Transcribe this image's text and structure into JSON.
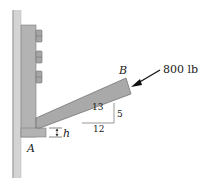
{
  "diagram": {
    "type": "statics-bracket",
    "labels": {
      "point_a": "A",
      "point_b": "B",
      "force": "800 lb",
      "dimension_h": "h"
    },
    "slope": {
      "hypotenuse": "13",
      "rise": "5",
      "run": "12"
    },
    "colors": {
      "wall": "#cfcfcf",
      "wall_edge": "#8a8a8a",
      "plate": "#b0b0b0",
      "arm": "#a8a8a8",
      "bolt": "#9a9a9a",
      "line": "#333333"
    }
  }
}
